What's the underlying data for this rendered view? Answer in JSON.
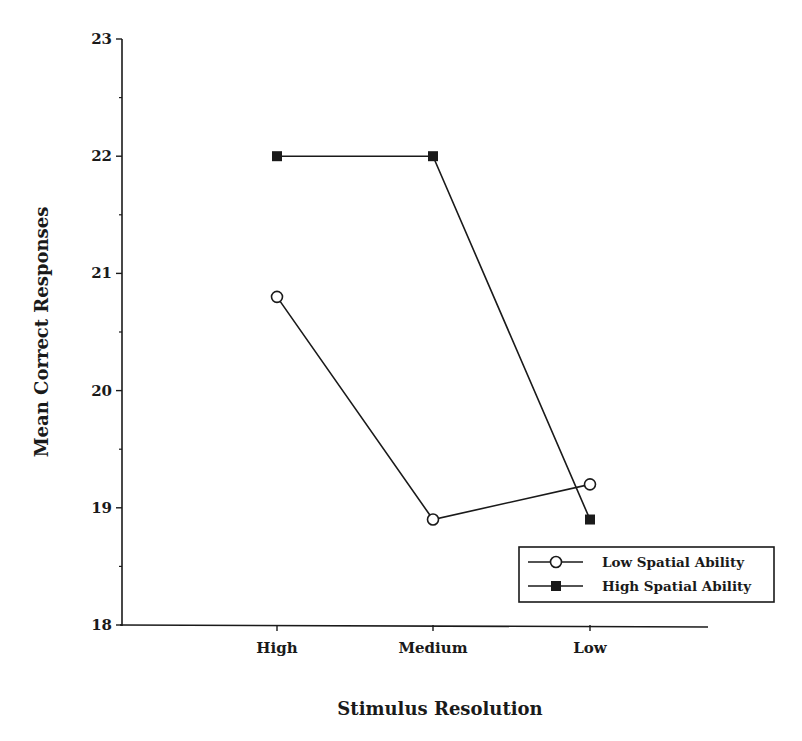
{
  "chart_data": {
    "type": "line",
    "title": "",
    "xlabel": "Stimulus Resolution",
    "ylabel": "Mean Correct Responses",
    "categories": [
      "High",
      "Medium",
      "Low"
    ],
    "ylim": [
      18,
      23
    ],
    "yticks": [
      18,
      19,
      20,
      21,
      22,
      23
    ],
    "y_minor_ticks": [
      18.5,
      19.5,
      20.5,
      21.5,
      22.5
    ],
    "grid": false,
    "legend_position": "lower right (inside plot)",
    "series": [
      {
        "name": "Low Spatial Ability",
        "marker": "open-circle",
        "values": [
          20.8,
          18.9,
          19.2
        ]
      },
      {
        "name": "High Spatial Ability",
        "marker": "filled-square",
        "values": [
          22.0,
          22.0,
          18.9
        ]
      }
    ],
    "colors": {
      "line": "#1a1a1a",
      "background": "#ffffff"
    }
  },
  "labels": {
    "xlabel": "Stimulus Resolution",
    "ylabel": "Mean Correct Responses",
    "categories": [
      "High",
      "Medium",
      "Low"
    ],
    "yticks": [
      "18",
      "19",
      "20",
      "21",
      "22",
      "23"
    ],
    "legend": [
      "Low Spatial Ability",
      "High Spatial Ability"
    ]
  }
}
